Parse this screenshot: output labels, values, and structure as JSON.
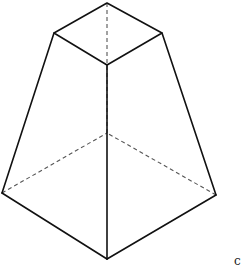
{
  "figure": {
    "colors": {
      "edge": "#111111",
      "hidden_edge": "#555555",
      "background": "#ffffff"
    },
    "vertices": {
      "top_back": [
        107,
        3
      ],
      "top_left": [
        54,
        33
      ],
      "top_right": [
        162,
        33
      ],
      "top_front": [
        107,
        65
      ],
      "bottom_left": [
        2,
        193
      ],
      "bottom_right": [
        216,
        195
      ],
      "bottom_front": [
        107,
        259
      ],
      "bottom_back": [
        107,
        133
      ]
    },
    "partial_label": "c"
  }
}
